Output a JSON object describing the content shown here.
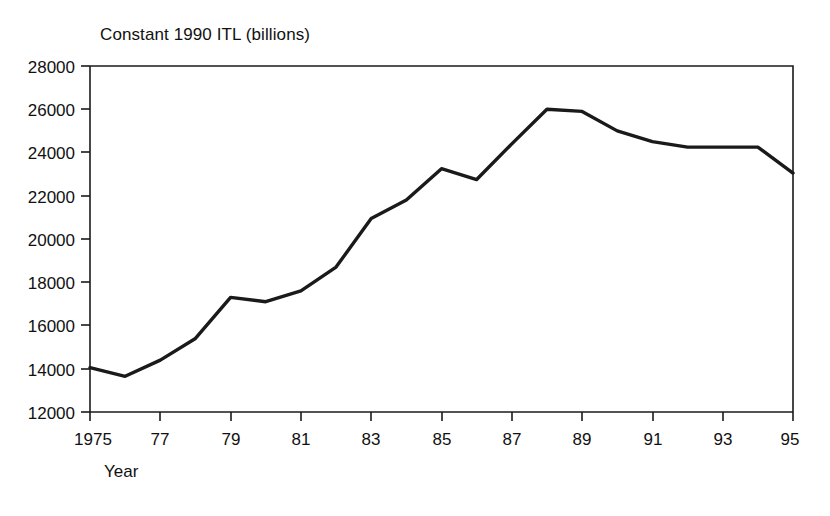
{
  "chart_data": {
    "type": "line",
    "title": "Constant 1990 ITL (billions)",
    "xlabel": "Year",
    "ylabel": "",
    "x": [
      1975,
      1976,
      1977,
      1978,
      1979,
      1980,
      1981,
      1982,
      1983,
      1984,
      1985,
      1986,
      1987,
      1988,
      1989,
      1990,
      1991,
      1992,
      1993,
      1994,
      1995
    ],
    "values": [
      14050,
      13650,
      14400,
      15400,
      17300,
      17100,
      17600,
      18700,
      20950,
      21800,
      23250,
      22750,
      24400,
      26000,
      25900,
      25000,
      24500,
      24250,
      24250,
      24250,
      23050
    ],
    "series": [
      {
        "name": "Constant 1990 ITL (billions)",
        "values": [
          14050,
          13650,
          14400,
          15400,
          17300,
          17100,
          17600,
          18700,
          20950,
          21800,
          23250,
          22750,
          24400,
          26000,
          25900,
          25000,
          24500,
          24250,
          24250,
          24250,
          23050
        ]
      }
    ],
    "xlim": [
      1975,
      1995
    ],
    "ylim": [
      12000,
      28000
    ],
    "grid": false,
    "legend": false,
    "line_color": "#1a1a1a",
    "background_color": "#ffffff",
    "y_ticks": [
      12000,
      14000,
      16000,
      18000,
      20000,
      22000,
      24000,
      26000,
      28000
    ],
    "y_tick_labels": [
      "12000",
      "14000",
      "16000",
      "18000",
      "20000",
      "22000",
      "24000",
      "26000",
      "28000"
    ],
    "x_ticks": [
      1975,
      1977,
      1979,
      1981,
      1983,
      1985,
      1987,
      1989,
      1991,
      1993,
      1995
    ],
    "x_tick_labels": [
      "1975",
      "77",
      "79",
      "81",
      "83",
      "85",
      "87",
      "89",
      "91",
      "93",
      "95"
    ]
  }
}
